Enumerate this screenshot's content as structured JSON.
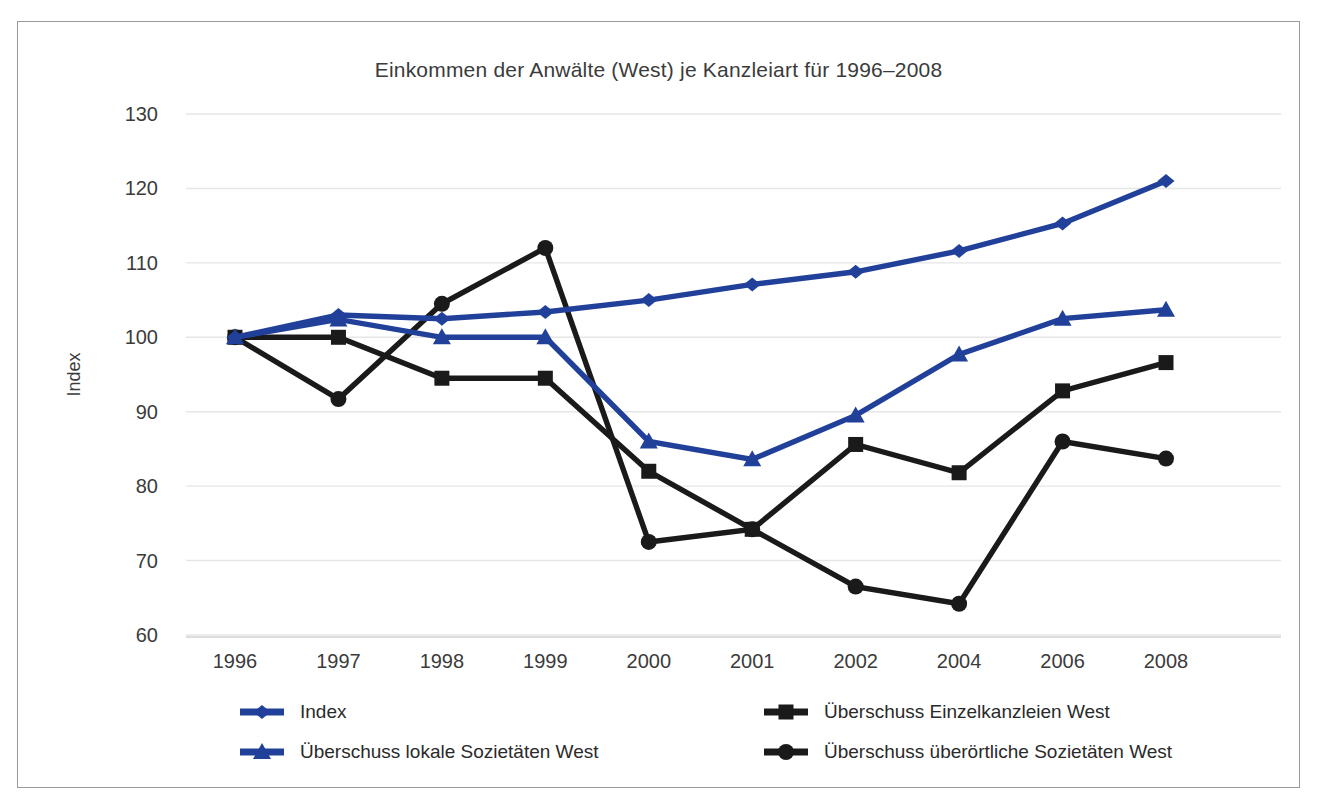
{
  "figure": {
    "title": "Einkommen der Anwälte (West) je Kanzleiart für 1996–2008",
    "border_color": "#9a9a9a",
    "background": "#ffffff"
  },
  "colors": {
    "blue": "#21409A",
    "black": "#1a1a1a",
    "grid": "#e6e6e6",
    "text": "#3b3b3b"
  },
  "chart_data": {
    "type": "line",
    "title": "Einkommen der Anwälte (West) je Kanzleiart für 1996–2008",
    "xlabel": "",
    "ylabel": "Index",
    "categories": [
      "1996",
      "1997",
      "1998",
      "1999",
      "2000",
      "2001",
      "2002",
      "2004",
      "2006",
      "2008"
    ],
    "ylim": [
      60,
      130
    ],
    "yticks": [
      60,
      70,
      80,
      90,
      100,
      110,
      120,
      130
    ],
    "grid": true,
    "legend_position": "bottom",
    "series": [
      {
        "name": "Index",
        "color": "#21409A",
        "marker": "diamond",
        "values": [
          100.0,
          103.0,
          102.5,
          103.4,
          105.0,
          107.1,
          108.8,
          111.6,
          115.3,
          121.0
        ]
      },
      {
        "name": "Überschuss lokale Sozietäten West",
        "color": "#21409A",
        "marker": "triangle",
        "values": [
          100.0,
          102.4,
          100.0,
          100.0,
          86.0,
          83.6,
          89.5,
          97.7,
          102.5,
          103.7
        ]
      },
      {
        "name": "Überschuss Einzelkanzleien West",
        "color": "#1a1a1a",
        "marker": "square",
        "values": [
          100.0,
          100.0,
          94.5,
          94.5,
          82.0,
          74.2,
          85.6,
          81.8,
          92.8,
          96.6
        ]
      },
      {
        "name": "Überschuss überörtliche Sozietäten West",
        "color": "#1a1a1a",
        "marker": "circle",
        "values": [
          100.0,
          91.7,
          104.5,
          112.0,
          72.5,
          74.2,
          66.5,
          64.2,
          86.0,
          83.7
        ]
      }
    ]
  },
  "legend": {
    "entries": [
      {
        "label": "Index",
        "marker": "diamond-marker-icon",
        "color": "#21409A"
      },
      {
        "label": "Überschuss Einzelkanzleien West",
        "marker": "square-marker-icon",
        "color": "#1a1a1a"
      },
      {
        "label": "Überschuss lokale Sozietäten West",
        "marker": "triangle-marker-icon",
        "color": "#21409A"
      },
      {
        "label": "Überschuss überörtliche Sozietäten West",
        "marker": "circle-marker-icon",
        "color": "#1a1a1a"
      }
    ]
  }
}
